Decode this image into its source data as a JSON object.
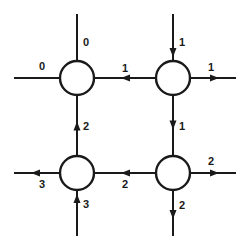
{
  "diagram": {
    "type": "flow-network",
    "nodes": [
      {
        "id": "top-left",
        "row": 0,
        "col": 0
      },
      {
        "id": "top-right",
        "row": 0,
        "col": 1
      },
      {
        "id": "bottom-left",
        "row": 1,
        "col": 0
      },
      {
        "id": "bottom-right",
        "row": 1,
        "col": 1
      }
    ],
    "edges": [
      {
        "id": "tl-top",
        "node": "top-left",
        "side": "top",
        "direction": "none",
        "label": "0"
      },
      {
        "id": "tl-left",
        "node": "top-left",
        "side": "left",
        "direction": "none",
        "label": "0"
      },
      {
        "id": "tr-top",
        "node": "top-right",
        "side": "top",
        "direction": "in",
        "label": "1"
      },
      {
        "id": "tr-right",
        "node": "top-right",
        "side": "right",
        "direction": "out",
        "label": "1"
      },
      {
        "id": "tr-to-tl",
        "from": "top-right",
        "to": "top-left",
        "label": "1"
      },
      {
        "id": "tr-to-br",
        "from": "top-right",
        "to": "bottom-right",
        "label": "1"
      },
      {
        "id": "bl-to-tl",
        "from": "bottom-left",
        "to": "top-left",
        "label": "2"
      },
      {
        "id": "br-to-bl",
        "from": "bottom-right",
        "to": "bottom-left",
        "label": "2"
      },
      {
        "id": "bl-left",
        "node": "bottom-left",
        "side": "left",
        "direction": "out",
        "label": "3"
      },
      {
        "id": "bl-bottom",
        "node": "bottom-left",
        "side": "bottom",
        "direction": "in",
        "label": "3"
      },
      {
        "id": "br-right",
        "node": "bottom-right",
        "side": "right",
        "direction": "out",
        "label": "2"
      },
      {
        "id": "br-bottom",
        "node": "bottom-right",
        "side": "bottom",
        "direction": "out",
        "label": "2"
      }
    ]
  }
}
